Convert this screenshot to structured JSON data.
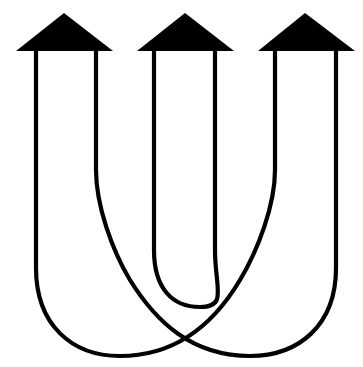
{
  "image": {
    "kind": "logo-mark",
    "title": "Triple Arrow U Logo",
    "width": 363,
    "height": 367,
    "background_color": "#ffffff",
    "stroke_color": "#000000",
    "fill_color": "#000000",
    "stroke_width": 4.2
  },
  "arrows": [
    {
      "name": "left-arrow",
      "apex": {
        "x": 64,
        "y": 13
      },
      "base_left": {
        "x": 16,
        "y": 51
      },
      "base_right": {
        "x": 113,
        "y": 51
      },
      "stem_left_x": 36,
      "stem_right_x": 96
    },
    {
      "name": "center-arrow",
      "apex": {
        "x": 185,
        "y": 13
      },
      "base_left": {
        "x": 137,
        "y": 51
      },
      "base_right": {
        "x": 234,
        "y": 51
      },
      "stem_left_x": 154,
      "stem_right_x": 215
    },
    {
      "name": "right-arrow",
      "apex": {
        "x": 305,
        "y": 13
      },
      "base_left": {
        "x": 258,
        "y": 51
      },
      "base_right": {
        "x": 355,
        "y": 51
      },
      "stem_left_x": 275,
      "stem_right_x": 336
    }
  ],
  "strokes": [
    {
      "name": "outer-u-path",
      "description": "Outer U: left stem x=36 down, round bottom, up to right stem x=275",
      "d": "M 36 51 L 36 268 C 36 325 72 356 120 356 C 178 356 215 322 240 280 C 258 250 275 205 275 170 L 275 51"
    },
    {
      "name": "middle-u-path",
      "description": "Middle U: left stem x=96 down, round bottom, up to right stem x=336",
      "d": "M 96 51 L 96 170 C 96 205 112 250 130 280 C 156 322 192 356 250 356 C 299 356 336 325 336 268 L 336 51"
    },
    {
      "name": "inner-u-path",
      "description": "Inner U: left stem x=154 down, short round bottom, up to right stem x=215",
      "d": "M 154 51 L 154 250 C 154 288 172 307 200 307 C 228 307 215 288 215 250 L 215 51"
    }
  ]
}
